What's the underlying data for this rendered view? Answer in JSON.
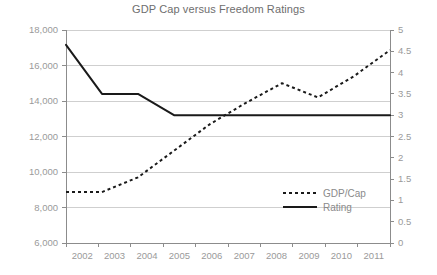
{
  "chart_data": {
    "type": "line",
    "title": "GDP Cap versus Freedom Ratings",
    "xlabel": "",
    "ylabel": "",
    "categories": [
      "2002",
      "2003",
      "2004",
      "2005",
      "2006",
      "2007",
      "2008",
      "2009",
      "2010",
      "2011"
    ],
    "x": [
      2002,
      2003,
      2004,
      2005,
      2006,
      2007,
      2008,
      2009,
      2010,
      2011
    ],
    "grid": true,
    "legend_position": "inside-lower-right",
    "series": [
      {
        "name": "GDP/Cap",
        "axis": "left",
        "style": "dotted",
        "color": "#1a1a1a",
        "values": [
          8870,
          8870,
          9700,
          11200,
          12700,
          13900,
          15000,
          14200,
          15400,
          16870
        ]
      },
      {
        "name": "Rating",
        "axis": "right",
        "style": "solid",
        "color": "#1a1a1a",
        "values": [
          4.65,
          3.5,
          3.5,
          3.0,
          3.0,
          3.0,
          3.0,
          3.0,
          3.0,
          3.0
        ]
      }
    ],
    "left_axis": {
      "label": "",
      "min": 6000,
      "max": 18000,
      "step": 2000,
      "ticks": [
        "6,000",
        "8,000",
        "10,000",
        "12,000",
        "14,000",
        "16,000",
        "18,000"
      ],
      "tick_values": [
        6000,
        8000,
        10000,
        12000,
        14000,
        16000,
        18000
      ]
    },
    "right_axis": {
      "label": "",
      "min": 0,
      "max": 5,
      "step": 0.5,
      "ticks": [
        "0",
        "0.5",
        "1",
        "1.5",
        "2",
        "2.5",
        "3",
        "3.5",
        "4",
        "4.5",
        "5"
      ],
      "tick_values": [
        0,
        0.5,
        1,
        1.5,
        2,
        2.5,
        3,
        3.5,
        4,
        4.5,
        5
      ]
    },
    "legend": [
      {
        "label": "GDP/Cap",
        "style": "dotted"
      },
      {
        "label": "Rating",
        "style": "solid"
      }
    ],
    "colors": {
      "title": "#6e6e6e",
      "tick": "#9a9a9a",
      "gridline": "#cfcfcf",
      "axis": "#8c8c8c",
      "series": "#1a1a1a",
      "background": "#ffffff"
    }
  }
}
